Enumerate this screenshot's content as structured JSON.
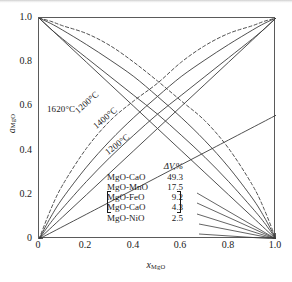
{
  "chart_data": {
    "type": "line",
    "title": "",
    "xlabel": "x_MgO",
    "ylabel": "a_MgO",
    "xlabel_base": "x",
    "xlabel_sub": "MgO",
    "ylabel_base": "a",
    "ylabel_sub": "MgO",
    "xlim": [
      0,
      1
    ],
    "ylim": [
      0,
      1
    ],
    "xticks": [
      "0",
      "0.2",
      "0.4",
      "0.6",
      "0.8",
      "1.0"
    ],
    "yticks": [
      "0",
      "0.2",
      "0.4",
      "0.6",
      "0.8",
      "1.0"
    ],
    "grid": false,
    "legend_position": "inside-lower-right",
    "annotations": [
      {
        "text": "1620°C",
        "x": 0.04,
        "y": 0.62,
        "rotation": 0,
        "style": "solid-label"
      },
      {
        "text": "1200°C",
        "x": 0.16,
        "y": 0.6,
        "rotation": -42,
        "style": "dashed-label"
      },
      {
        "text": "1400°C",
        "x": 0.24,
        "y": 0.53,
        "rotation": -40,
        "style": "solid-label"
      },
      {
        "text": "1200°C",
        "x": 0.3,
        "y": 0.41,
        "rotation": -38,
        "style": "solid-label"
      }
    ],
    "series": [
      {
        "name": "1620°C ascending (ideal diagonal)",
        "linestyle": "solid",
        "x": [
          0,
          0.1,
          0.2,
          0.3,
          0.4,
          0.5,
          0.6,
          0.7,
          0.8,
          0.9,
          1.0
        ],
        "values": [
          0,
          0.1,
          0.2,
          0.3,
          0.4,
          0.5,
          0.6,
          0.7,
          0.8,
          0.9,
          1.0
        ]
      },
      {
        "name": "1620°C descending (ideal diagonal)",
        "linestyle": "solid",
        "x": [
          0,
          0.1,
          0.2,
          0.3,
          0.4,
          0.5,
          0.6,
          0.7,
          0.8,
          0.9,
          1.0
        ],
        "values": [
          1.0,
          0.9,
          0.8,
          0.7,
          0.6,
          0.5,
          0.4,
          0.3,
          0.2,
          0.1,
          0
        ]
      },
      {
        "name": "1400°C ascending",
        "linestyle": "solid",
        "x": [
          0,
          0.05,
          0.1,
          0.2,
          0.3,
          0.4,
          0.5,
          0.6,
          0.7,
          0.8,
          0.9,
          0.95,
          1.0
        ],
        "values": [
          0,
          0.075,
          0.14,
          0.26,
          0.37,
          0.47,
          0.565,
          0.65,
          0.735,
          0.82,
          0.905,
          0.95,
          1.0
        ]
      },
      {
        "name": "1400°C descending",
        "linestyle": "solid",
        "x": [
          0,
          0.05,
          0.1,
          0.2,
          0.3,
          0.4,
          0.5,
          0.6,
          0.7,
          0.8,
          0.9,
          0.95,
          1.0
        ],
        "values": [
          1.0,
          0.95,
          0.905,
          0.82,
          0.735,
          0.65,
          0.565,
          0.47,
          0.37,
          0.26,
          0.14,
          0.075,
          0
        ]
      },
      {
        "name": "1200°C ascending",
        "linestyle": "solid",
        "x": [
          0,
          0.05,
          0.1,
          0.2,
          0.3,
          0.4,
          0.5,
          0.6,
          0.7,
          0.8,
          0.9,
          0.95,
          1.0
        ],
        "values": [
          0,
          0.1,
          0.185,
          0.325,
          0.445,
          0.55,
          0.645,
          0.735,
          0.81,
          0.88,
          0.945,
          0.975,
          1.0
        ]
      },
      {
        "name": "1200°C descending",
        "linestyle": "solid",
        "x": [
          0,
          0.05,
          0.1,
          0.2,
          0.3,
          0.4,
          0.5,
          0.6,
          0.7,
          0.8,
          0.9,
          0.95,
          1.0
        ],
        "values": [
          1.0,
          0.975,
          0.945,
          0.88,
          0.81,
          0.735,
          0.645,
          0.55,
          0.445,
          0.325,
          0.185,
          0.1,
          0
        ]
      },
      {
        "name": "MgO-NiO low slope (solid)",
        "linestyle": "solid",
        "x": [
          0,
          0.25,
          0.5,
          0.75,
          1.0
        ],
        "values": [
          0,
          0.14,
          0.28,
          0.42,
          0.56
        ]
      },
      {
        "name": "1200°C dashed ascending",
        "linestyle": "dashed",
        "x": [
          0,
          0.05,
          0.1,
          0.2,
          0.3,
          0.4,
          0.5,
          0.6,
          0.7,
          0.8,
          0.9,
          0.95,
          1.0
        ],
        "values": [
          0,
          0.135,
          0.245,
          0.41,
          0.535,
          0.625,
          0.705,
          0.8,
          0.875,
          0.93,
          0.965,
          0.985,
          1.0
        ]
      },
      {
        "name": "1200°C dashed descending",
        "linestyle": "dashed",
        "x": [
          0,
          0.05,
          0.1,
          0.2,
          0.3,
          0.4,
          0.5,
          0.6,
          0.7,
          0.8,
          0.9,
          0.95,
          1.0
        ],
        "values": [
          1.0,
          0.985,
          0.965,
          0.93,
          0.875,
          0.8,
          0.715,
          0.625,
          0.535,
          0.41,
          0.245,
          0.135,
          0
        ]
      }
    ],
    "legend_table": {
      "header_delta": "ΔV",
      "header_unit": ",%",
      "rows": [
        {
          "system": "MgO-CaO",
          "dv": "49.3",
          "braced": false
        },
        {
          "system": "MgO-MnO",
          "dv": "17.5",
          "braced": false
        },
        {
          "system": "MgO-FeO",
          "dv": "9.2",
          "braced": false
        },
        {
          "system": "MgO-CaO",
          "dv": "4.3",
          "braced": true
        },
        {
          "system": "MgO-NiO",
          "dv": "2.5",
          "braced": true
        }
      ]
    }
  },
  "colors": {
    "line": "#3c3c3c",
    "axis": "#5a5a5a",
    "text": "#1a1a1a",
    "background": "#ffffff"
  }
}
